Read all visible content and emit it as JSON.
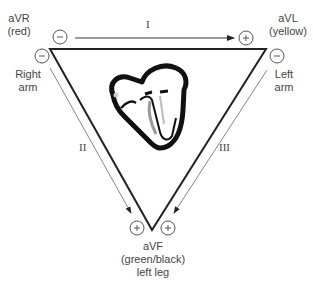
{
  "diagram": {
    "electrodes": {
      "avr": {
        "name": "aVR",
        "color_label": "(red)",
        "limb": "Right",
        "limb2": "arm"
      },
      "avl": {
        "name": "aVL",
        "color_label": "(yellow)",
        "limb": "Left",
        "limb2": "arm"
      },
      "avf": {
        "name": "aVF",
        "color_label": "(green/black)",
        "limb": "left leg"
      }
    },
    "leads": [
      {
        "id": "I",
        "label": "I",
        "from": "aVR",
        "to": "aVL"
      },
      {
        "id": "II",
        "label": "II",
        "from": "aVR",
        "to": "aVF"
      },
      {
        "id": "III",
        "label": "III",
        "from": "aVL",
        "to": "aVF"
      }
    ],
    "polarity": {
      "negative": "−",
      "positive": "+"
    },
    "center_image": "heart-icon"
  }
}
